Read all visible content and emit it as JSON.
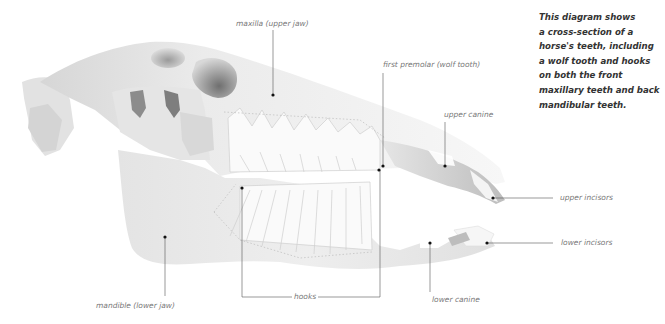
{
  "diagram": {
    "caption_lines": [
      "This diagram shows",
      "a cross-section of a",
      "horse's teeth, including",
      "a wolf tooth and hooks",
      "on both the front",
      "maxillary teeth and back",
      "mandibular teeth."
    ],
    "labels": {
      "maxilla": "maxilla (upper jaw)",
      "first_premolar": "first premolar (wolf tooth)",
      "upper_canine": "upper canine",
      "upper_incisors": "upper incisors",
      "lower_incisors": "lower incisors",
      "lower_canine": "lower canine",
      "hooks": "hooks",
      "mandible": "mandible (lower jaw)"
    },
    "colors": {
      "bone_light": "#f2f2f2",
      "bone_mid": "#dcdcdc",
      "bone_dark": "#8a8a8a",
      "leader_line": "#555555",
      "dot": "#111111",
      "label_text": "#777777",
      "caption_text": "#333333"
    }
  }
}
